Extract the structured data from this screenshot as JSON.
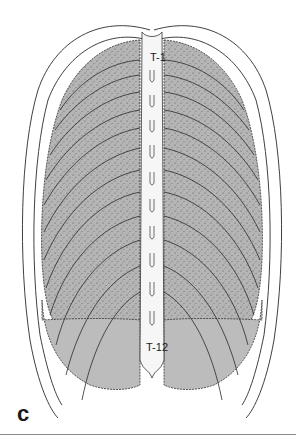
{
  "figure": {
    "type": "anatomical-illustration",
    "labels": {
      "top_vertebra": "T-1",
      "bottom_vertebra": "T-12",
      "panel": "c"
    },
    "colors": {
      "lung_fill": "#b8b8b8",
      "lung_dark": "#9a9a9a",
      "outline": "#2a2a2a",
      "spine_fill": "#f6f6f6",
      "rule": "#8a8a8a",
      "background": "#ffffff"
    }
  }
}
